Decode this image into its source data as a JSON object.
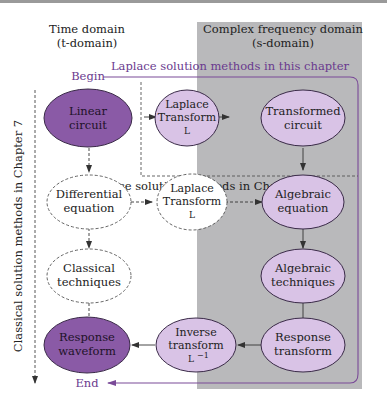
{
  "colors": {
    "panel_gray": "#b9b9bb",
    "solid_node_fill": "#8a5aa6",
    "light_node_fill": "#d9c3e6",
    "node_stroke": "#3a2a48",
    "dashed_node_fill": "#ffffff",
    "flow_line": "#7a4a98",
    "flow_text": "#6a3a8e",
    "arrow": "#333333",
    "text": "#222222"
  },
  "headers": {
    "time_domain_line1": "Time domain",
    "time_domain_line2": "(t-domain)",
    "freq_domain_line1": "Complex frequency domain",
    "freq_domain_line2": "(s-domain)"
  },
  "labels": {
    "begin": "Begin",
    "end": "End",
    "laplace_this_chapter": "Laplace solution methods in this chapter",
    "laplace_chapter_9": "Laplace solution methods in Chapter 9",
    "classical_chapter_7": "Classical solution methods in Chapter 7"
  },
  "nodes": {
    "linear_circuit": {
      "line1": "Linear",
      "line2": "circuit"
    },
    "laplace_transform_top": {
      "line1": "Laplace",
      "line2": "Transform",
      "line3": "L"
    },
    "transformed_circuit": {
      "line1": "Transformed",
      "line2": "circuit"
    },
    "differential_equation": {
      "line1": "Differential",
      "line2": "equation"
    },
    "laplace_transform_mid": {
      "line1": "Laplace",
      "line2": "Transform",
      "line3": "L"
    },
    "algebraic_equation": {
      "line1": "Algebraic",
      "line2": "equation"
    },
    "classical_techniques": {
      "line1": "Classical",
      "line2": "techniques"
    },
    "algebraic_techniques": {
      "line1": "Algebraic",
      "line2": "techniques"
    },
    "response_waveform": {
      "line1": "Response",
      "line2": "waveform"
    },
    "inverse_transform": {
      "line1": "Inverse",
      "line2": "transform",
      "line3": "L",
      "sup": "−1"
    },
    "response_transform": {
      "line1": "Response",
      "line2": "transform"
    }
  }
}
